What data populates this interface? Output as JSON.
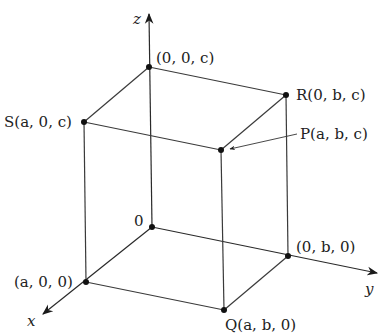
{
  "diagram": {
    "axes": {
      "x": {
        "label": "x"
      },
      "y": {
        "label": "y"
      },
      "z": {
        "label": "z"
      }
    },
    "points": {
      "origin": {
        "label": "0"
      },
      "a00": {
        "label": "(a, 0, 0)"
      },
      "0b0": {
        "label": "(0, b, 0)"
      },
      "00c": {
        "label": "(0, 0, c)"
      },
      "Q": {
        "label": "Q(a, b, 0)"
      },
      "S": {
        "label": "S(a, 0, c)"
      },
      "R": {
        "label": "R(0, b, c)"
      },
      "P": {
        "label": "P(a, b, c)"
      }
    },
    "colors": {
      "line": "#3a3a3a",
      "point": "#111111",
      "text": "#222222",
      "background": "#ffffff"
    }
  }
}
